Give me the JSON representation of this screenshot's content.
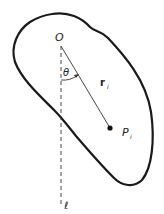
{
  "diagram": {
    "type": "rigid-body-rotation-figure",
    "colors": {
      "outline": "#1a1a1a",
      "line": "#333333",
      "background": "#ffffff"
    },
    "labels": {
      "origin": "O",
      "angle": "θ",
      "position_vector": "r",
      "position_vector_subscript": "i",
      "point": "P",
      "point_subscript": "i",
      "axis": "ℓ"
    },
    "elements": [
      {
        "name": "body-outline",
        "kind": "closed-curve"
      },
      {
        "name": "axis-line",
        "kind": "dashed-line",
        "label": "ℓ"
      },
      {
        "name": "position-vector",
        "kind": "line",
        "from": "O",
        "to": "P_i"
      },
      {
        "name": "angle-arc",
        "kind": "arc-with-arrow",
        "label": "θ"
      },
      {
        "name": "point-p",
        "kind": "dot",
        "label": "P_i"
      }
    ]
  }
}
